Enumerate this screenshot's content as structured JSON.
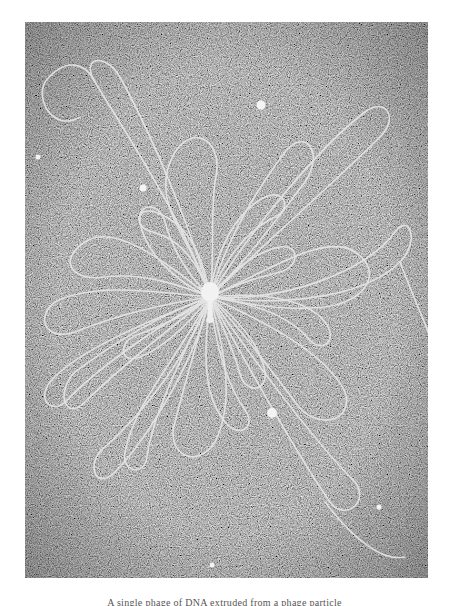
{
  "figure": {
    "background_color": "#6e6e6e",
    "strand_color": "#e6e6e6",
    "central_particle": {
      "label": "phage-head-and-tail",
      "x": 185,
      "y": 275
    },
    "beads": [
      {
        "x": 236,
        "y": 83
      },
      {
        "x": 118,
        "y": 166
      },
      {
        "x": 13,
        "y": 135
      },
      {
        "x": 247,
        "y": 391
      },
      {
        "x": 354,
        "y": 485
      },
      {
        "x": 187,
        "y": 543
      }
    ]
  },
  "caption": "A single phage of DNA extruded from a phage particle"
}
